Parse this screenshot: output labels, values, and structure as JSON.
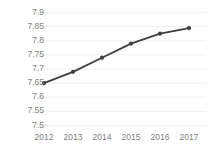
{
  "chart_data": {
    "type": "line",
    "title": "",
    "xlabel": "",
    "ylabel": "Million(People)",
    "categories": [
      "2012",
      "2013",
      "2014",
      "2015",
      "2016",
      "2017"
    ],
    "values": [
      7.65,
      7.69,
      7.74,
      7.79,
      7.825,
      7.845
    ],
    "series": [
      {
        "name": "Population",
        "values": [
          7.65,
          7.69,
          7.74,
          7.79,
          7.825,
          7.845
        ]
      }
    ],
    "ylim": [
      7.5,
      7.9
    ],
    "ytick_labels": [
      "7.9",
      "7.85",
      "7.8",
      "7.75",
      "7.7",
      "7.65",
      "7.6",
      "7.55",
      "7.5"
    ],
    "ytick_values": [
      7.9,
      7.85,
      7.8,
      7.75,
      7.7,
      7.65,
      7.6,
      7.55,
      7.5
    ],
    "xtick_labels": [
      "2012",
      "2013",
      "2014",
      "2015",
      "2016",
      "2017"
    ],
    "grid": true,
    "grid_axis": "y",
    "legend": false,
    "legend_position": "none",
    "colors": {
      "line": "#3f3f3f",
      "marker": "#3f3f3f",
      "grid": "#f2f2f2",
      "tick_text": "#808080",
      "background": "#ffffff"
    },
    "marker_style": "circle",
    "line_width": 1.8
  }
}
